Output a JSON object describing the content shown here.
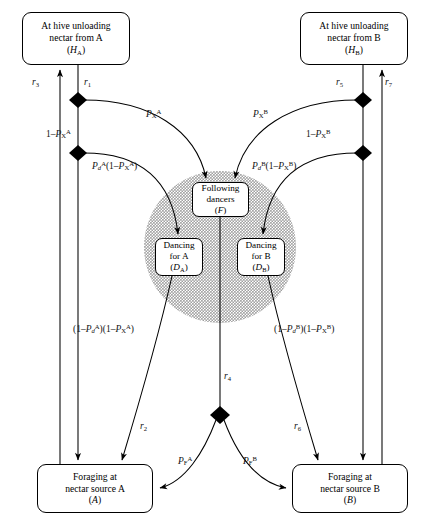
{
  "figure": {
    "type": "state-transition-diagram"
  },
  "nodes": [
    {
      "id": "HA",
      "lines": [
        "At hive unloading",
        "nectar from A"
      ],
      "symbol": "(H",
      "sub": "A",
      "close": ")",
      "x": 22,
      "y": 12,
      "w": 108,
      "h": 53
    },
    {
      "id": "HB",
      "lines": [
        "At hive unloading",
        "nectar from B"
      ],
      "symbol": "(H",
      "sub": "B",
      "close": ")",
      "x": 300,
      "y": 12,
      "w": 108,
      "h": 53
    },
    {
      "id": "F",
      "lines": [
        "Following",
        "dancers"
      ],
      "symbol": "(F",
      "sub": "",
      "close": ")",
      "x": 192,
      "y": 182,
      "w": 57,
      "h": 35
    },
    {
      "id": "DA",
      "lines": [
        "Dancing",
        "for A"
      ],
      "symbol": "(D",
      "sub": "A",
      "close": ")",
      "x": 155,
      "y": 238,
      "w": 48,
      "h": 38
    },
    {
      "id": "DB",
      "lines": [
        "Dancing",
        "for B"
      ],
      "symbol": "(D",
      "sub": "B",
      "close": ")",
      "x": 237,
      "y": 238,
      "w": 48,
      "h": 38
    },
    {
      "id": "A",
      "lines": [
        "Foraging at",
        "nectar source A"
      ],
      "symbol": "(A",
      "sub": "",
      "close": ")",
      "x": 37,
      "y": 464,
      "w": 116,
      "h": 49
    },
    {
      "id": "B",
      "lines": [
        "Foraging at",
        "nectar source B"
      ],
      "symbol": "(B",
      "sub": "",
      "close": ")",
      "x": 292,
      "y": 464,
      "w": 116,
      "h": 49
    }
  ],
  "rate_labels": [
    {
      "id": "r3",
      "base": "r",
      "sub": "3",
      "x": 32,
      "y": 78
    },
    {
      "id": "r1",
      "base": "r",
      "sub": "1",
      "x": 84,
      "y": 78
    },
    {
      "id": "r5",
      "base": "r",
      "sub": "5",
      "x": 336,
      "y": 78
    },
    {
      "id": "r7",
      "base": "r",
      "sub": "7",
      "x": 385,
      "y": 78
    },
    {
      "id": "r2",
      "base": "r",
      "sub": "2",
      "x": 140,
      "y": 422
    },
    {
      "id": "r4",
      "base": "r",
      "sub": "4",
      "x": 224,
      "y": 372
    },
    {
      "id": "r6",
      "base": "r",
      "sub": "6",
      "x": 294,
      "y": 422
    }
  ],
  "prob_labels": [
    {
      "id": "PXA",
      "x": 146,
      "y": 108,
      "parts": [
        {
          "t": "P",
          "i": true
        },
        {
          "t": "X",
          "sub": true
        },
        {
          "t": "A",
          "sup": true
        }
      ]
    },
    {
      "id": "PXB",
      "x": 253,
      "y": 108,
      "parts": [
        {
          "t": "P",
          "i": true
        },
        {
          "t": "X",
          "sub": true
        },
        {
          "t": "B",
          "sup": true
        }
      ]
    },
    {
      "id": "oneMinusPXA",
      "x": 46,
      "y": 128,
      "parts": [
        {
          "t": "1–"
        },
        {
          "t": "P",
          "i": true
        },
        {
          "t": "X",
          "sub": true
        },
        {
          "t": "A",
          "sup": true
        }
      ]
    },
    {
      "id": "oneMinusPXB",
      "x": 306,
      "y": 128,
      "parts": [
        {
          "t": "1–"
        },
        {
          "t": "P",
          "i": true
        },
        {
          "t": "X",
          "sub": true
        },
        {
          "t": "B",
          "sup": true
        }
      ]
    },
    {
      "id": "PdA",
      "x": 92,
      "y": 160,
      "parts": [
        {
          "t": "P",
          "i": true
        },
        {
          "t": "d",
          "sub": true,
          "i": true
        },
        {
          "t": "A",
          "sup": true
        },
        {
          "t": "(1–"
        },
        {
          "t": "P",
          "i": true
        },
        {
          "t": "X",
          "sub": true
        },
        {
          "t": "A",
          "sup": true
        },
        {
          "t": ")"
        }
      ]
    },
    {
      "id": "PdB",
      "x": 252,
      "y": 160,
      "parts": [
        {
          "t": "P",
          "i": true
        },
        {
          "t": "d",
          "sub": true,
          "i": true
        },
        {
          "t": "B",
          "sup": true
        },
        {
          "t": "(1–"
        },
        {
          "t": "P",
          "i": true
        },
        {
          "t": "X",
          "sub": true
        },
        {
          "t": "B",
          "sup": true
        },
        {
          "t": ")"
        }
      ]
    },
    {
      "id": "leftExit",
      "x": 73,
      "y": 323,
      "parts": [
        {
          "t": "(1–"
        },
        {
          "t": "P",
          "i": true
        },
        {
          "t": "d",
          "sub": true,
          "i": true
        },
        {
          "t": "A",
          "sup": true
        },
        {
          "t": ")(1–"
        },
        {
          "t": "P",
          "i": true
        },
        {
          "t": "X",
          "sub": true
        },
        {
          "t": "A",
          "sup": true
        },
        {
          "t": ")"
        }
      ]
    },
    {
      "id": "rightExit",
      "x": 274,
      "y": 323,
      "parts": [
        {
          "t": "(1–"
        },
        {
          "t": "P",
          "i": true
        },
        {
          "t": "d",
          "sub": true,
          "i": true
        },
        {
          "t": "B",
          "sup": true
        },
        {
          "t": ")(1–"
        },
        {
          "t": "P",
          "i": true
        },
        {
          "t": "X",
          "sub": true
        },
        {
          "t": "B",
          "sup": true
        },
        {
          "t": ")"
        }
      ]
    },
    {
      "id": "PFA",
      "x": 178,
      "y": 455,
      "parts": [
        {
          "t": "P",
          "i": true
        },
        {
          "t": "F",
          "sub": true
        },
        {
          "t": "A",
          "sup": true
        }
      ]
    },
    {
      "id": "PFB",
      "x": 243,
      "y": 455,
      "parts": [
        {
          "t": "P",
          "i": true
        },
        {
          "t": "F",
          "sub": true
        },
        {
          "t": "B",
          "sup": true
        }
      ]
    }
  ],
  "junctions": [
    {
      "id": "j-left-upper",
      "x": 78,
      "y": 100
    },
    {
      "id": "j-left-lower",
      "x": 78,
      "y": 153
    },
    {
      "id": "j-right-upper",
      "x": 363,
      "y": 100
    },
    {
      "id": "j-right-lower",
      "x": 363,
      "y": 153
    },
    {
      "id": "j-bottom-center",
      "x": 220,
      "y": 415
    }
  ],
  "shaded_region": {
    "id": "dance-floor",
    "cx": 220,
    "cy": 247,
    "r": 76,
    "color": "#c8c8c8"
  },
  "colors": {
    "stroke": "#000000",
    "fill": "#ffffff",
    "shade": "#c8c8c8",
    "text": "#000000"
  }
}
